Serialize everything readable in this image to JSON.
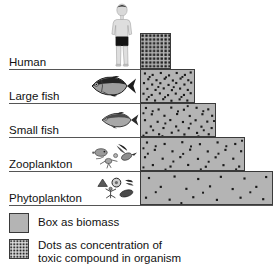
{
  "diagram": {
    "colors": {
      "box_fill": "#b4b4b4",
      "box_stroke": "#3a3a3a",
      "dot": "#1a1a1a",
      "separator": "#555555",
      "text": "#111111",
      "background": "#ffffff"
    },
    "tiers": [
      {
        "label": "Human",
        "icon": "human-figure-icon",
        "bar": {
          "x": 140,
          "y": 33,
          "width": 31,
          "height": 36
        },
        "dot_count": 120,
        "dot_density": "very-high",
        "separator_y": 69,
        "label_x": 9,
        "label_y": 57
      },
      {
        "label": "Large fish",
        "icon": "large-fish-icon",
        "bar": {
          "x": 140,
          "y": 69,
          "width": 55,
          "height": 34
        },
        "dot_count": 60,
        "dot_density": "high",
        "separator_y": 103,
        "label_x": 9,
        "label_y": 91
      },
      {
        "label": "Small fish",
        "icon": "small-fish-icon",
        "bar": {
          "x": 140,
          "y": 103,
          "width": 76,
          "height": 34
        },
        "dot_count": 46,
        "dot_density": "medium",
        "separator_y": 137,
        "label_x": 9,
        "label_y": 125
      },
      {
        "label": "Zooplankton",
        "icon": "zooplankton-icon",
        "bar": {
          "x": 140,
          "y": 137,
          "width": 105,
          "height": 34
        },
        "dot_count": 38,
        "dot_density": "low",
        "separator_y": 171,
        "label_x": 9,
        "label_y": 159
      },
      {
        "label": "Phytoplankton",
        "icon": "phytoplankton-icon",
        "bar": {
          "x": 140,
          "y": 171,
          "width": 133,
          "height": 34
        },
        "dot_count": 22,
        "dot_density": "very-low",
        "separator_y": 205,
        "label_x": 9,
        "label_y": 193
      }
    ],
    "legend": {
      "items": [
        {
          "swatch": "box-biomass-swatch",
          "text": "Box as biomass"
        },
        {
          "swatch": "dots-toxin-swatch",
          "text": "Dots as concentration of\ntoxic compound in organism"
        }
      ]
    }
  }
}
